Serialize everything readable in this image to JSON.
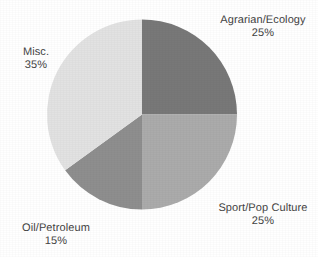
{
  "chart_data": {
    "type": "pie",
    "title": "",
    "subtitle": "",
    "xlabel": "",
    "ylabel": "",
    "legend_position": "none",
    "grid": false,
    "label_format": "name above, percent below",
    "start_angle_deg": 0,
    "direction": "clockwise",
    "categories": [
      "Agrarian/Ecology",
      "Sport/Pop Culture",
      "Oil/Petroleum",
      "Misc."
    ],
    "values": [
      25,
      25,
      15,
      35
    ],
    "units": "%",
    "slices": [
      {
        "name": "Agrarian/Ecology",
        "value": 25,
        "percent_label": "25%",
        "color": "#787878",
        "start_deg": 0,
        "end_deg": 90
      },
      {
        "name": "Sport/Pop Culture",
        "value": 25,
        "percent_label": "25%",
        "color": "#ababab",
        "start_deg": 90,
        "end_deg": 180
      },
      {
        "name": "Oil/Petroleum",
        "value": 15,
        "percent_label": "15%",
        "color": "#8e8e8e",
        "start_deg": 180,
        "end_deg": 234
      },
      {
        "name": "Misc.",
        "value": 35,
        "percent_label": "35%",
        "color": "#e2e2e2",
        "start_deg": 234,
        "end_deg": 360
      }
    ],
    "background_color": "#ffffff",
    "text_color": "#434343"
  },
  "labels": {
    "agrarian": {
      "name": "Agrarian/Ecology",
      "percent": "25%"
    },
    "sport": {
      "name": "Sport/Pop Culture",
      "percent": "25%"
    },
    "oil": {
      "name": "Oil/Petroleum",
      "percent": "15%"
    },
    "misc": {
      "name": "Misc.",
      "percent": "35%"
    }
  }
}
